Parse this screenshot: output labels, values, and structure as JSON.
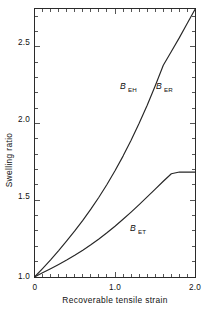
{
  "chart_data": {
    "type": "line",
    "title": "",
    "subtitle": "",
    "xlabel": "Recoverable tensile strain",
    "ylabel": "Swelling ratio",
    "xlim": [
      0,
      2.0
    ],
    "ylim": [
      1.0,
      2.75
    ],
    "grid": false,
    "legend_position": "inline-annotations",
    "x_major_ticks": [
      0,
      1.0,
      2.0
    ],
    "x_major_tick_labels": [
      "0",
      "1.0",
      "2.0"
    ],
    "x_minor_tick_step": 0.1,
    "y_major_ticks": [
      1.0,
      1.5,
      2.0,
      2.5
    ],
    "y_major_tick_labels": [
      "1.0",
      "1.5",
      "2.0",
      "2.5"
    ],
    "y_minor_tick_step": 0.1,
    "tick_direction": "in",
    "frame": "box",
    "line_color": "#262626",
    "series": [
      {
        "name": "B_EH / B_ER",
        "label_base": "B",
        "label_sub_left": "EH",
        "label_sub_right": "ER",
        "x": [
          0.0,
          0.1,
          0.2,
          0.3,
          0.4,
          0.5,
          0.6,
          0.7,
          0.8,
          0.9,
          1.0,
          1.1,
          1.2,
          1.3,
          1.4,
          1.5,
          1.6,
          1.7,
          1.8,
          1.9,
          2.0
        ],
        "values": [
          1.0,
          1.055,
          1.112,
          1.172,
          1.235,
          1.3,
          1.369,
          1.442,
          1.52,
          1.603,
          1.692,
          1.788,
          1.891,
          2.002,
          2.12,
          2.246,
          2.38,
          2.47,
          2.56,
          2.655,
          2.75
        ]
      },
      {
        "name": "B_ET",
        "label_base": "B",
        "label_sub_left": "ET",
        "label_sub_right": "",
        "x": [
          0.0,
          0.1,
          0.2,
          0.3,
          0.4,
          0.5,
          0.6,
          0.7,
          0.8,
          0.9,
          1.0,
          1.1,
          1.2,
          1.3,
          1.4,
          1.5,
          1.6,
          1.7,
          1.8,
          1.9,
          2.0
        ],
        "values": [
          1.0,
          1.027,
          1.054,
          1.082,
          1.111,
          1.142,
          1.175,
          1.21,
          1.248,
          1.288,
          1.331,
          1.376,
          1.423,
          1.472,
          1.522,
          1.573,
          1.624,
          1.673,
          1.684,
          1.684,
          1.684
        ]
      }
    ],
    "annotations": [
      {
        "text": "B",
        "sub": "EH",
        "x_px": 123,
        "y_px": 89
      },
      {
        "text": "B",
        "sub": "ER",
        "x_px": 159,
        "y_px": 89
      },
      {
        "text": "B",
        "sub": "ET",
        "x_px": 133,
        "y_px": 231
      }
    ]
  },
  "axes": {
    "x_title": "Recoverable tensile strain",
    "y_title": "Swelling ratio",
    "x_labels": [
      "0",
      "1.0",
      "2.0"
    ],
    "y_labels": [
      "2.5",
      "2.0",
      "1.5",
      "1.0"
    ]
  },
  "labels": {
    "beh_base": "B",
    "beh_sub": "EH",
    "ber_base": "B",
    "ber_sub": "ER",
    "bet_base": "B",
    "bet_sub": "ET"
  }
}
